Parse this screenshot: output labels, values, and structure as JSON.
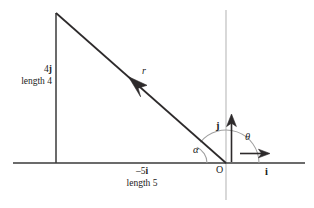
{
  "figure": {
    "background_color": "#ffffff",
    "line_color": "#231f20",
    "axis_color": "#b8b8b8",
    "arc_color": "#9a9a9a",
    "width": 314,
    "height": 208
  },
  "labels": {
    "vertical_component": "4",
    "vertical_unit": "j",
    "vertical_length": "length 4",
    "horizontal_component": "–5",
    "horizontal_unit": "i",
    "horizontal_length": "length 5",
    "resultant": "r",
    "theta": "θ",
    "alpha": "α",
    "basis_i": "i",
    "basis_j": "j",
    "origin": "O"
  },
  "geometry": {
    "origin_x": 226,
    "origin_y": 163,
    "apex_x": 56,
    "apex_y": 13,
    "x_axis_start": 13,
    "x_axis_end": 305,
    "y_axis_top": 10,
    "y_axis_bottom": 200,
    "i_arrow_end": 268,
    "j_arrow_end": 117,
    "theta_radius": 33,
    "alpha_radius": 17,
    "alpha_vertex_x": 190,
    "theta_degrees": 141,
    "alpha_degrees": 39
  }
}
